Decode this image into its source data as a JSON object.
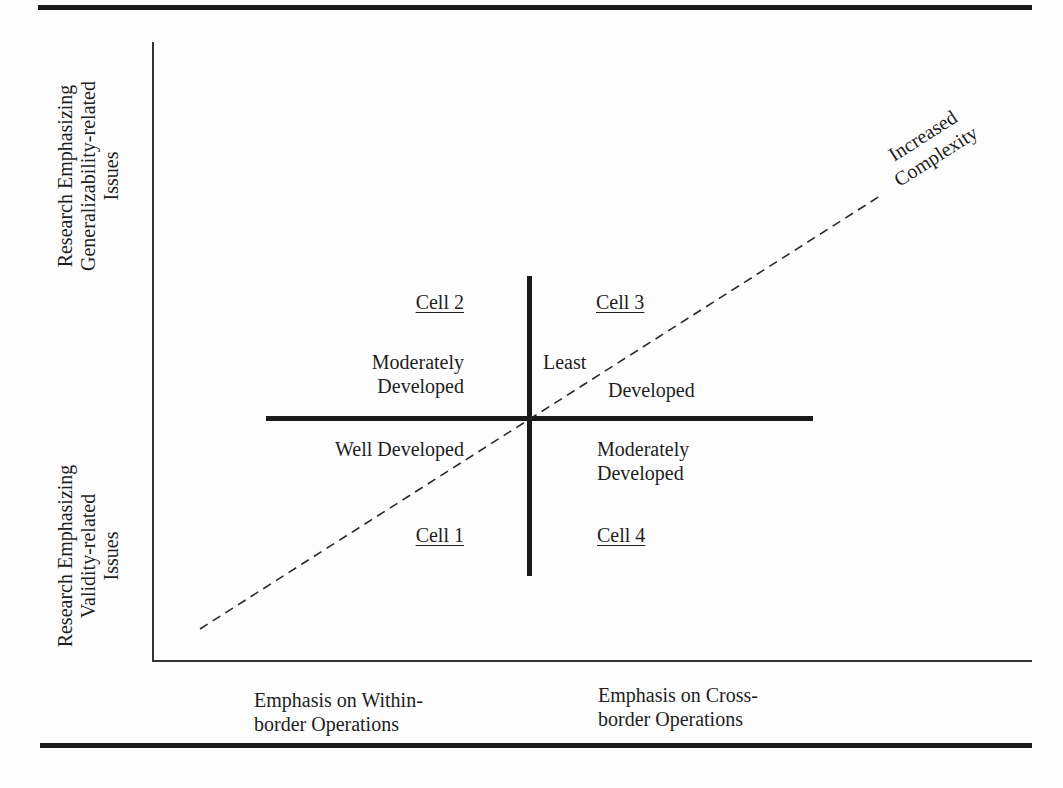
{
  "figure": {
    "y_axis": {
      "upper_label": [
        "Research Emphasizing",
        "Generalizability-related",
        "Issues"
      ],
      "lower_label": [
        "Research Emphasizing",
        "Validity-related",
        "Issues"
      ]
    },
    "x_axis": {
      "left_label": [
        "Emphasis on Within-",
        "border Operations"
      ],
      "right_label": [
        "Emphasis on Cross-",
        "border Operations"
      ]
    },
    "diagonal": {
      "label": [
        "Increased",
        "Complexity"
      ],
      "style": "dashed"
    },
    "cells": [
      {
        "id": "cell-1",
        "title": "Cell 1",
        "description": [
          "Well Developed"
        ]
      },
      {
        "id": "cell-2",
        "title": "Cell 2",
        "description": [
          "Moderately",
          "Developed"
        ]
      },
      {
        "id": "cell-3",
        "title": "Cell 3",
        "description": [
          "Least",
          "Developed"
        ]
      },
      {
        "id": "cell-4",
        "title": "Cell 4",
        "description": [
          "Moderately",
          "Developed"
        ]
      }
    ],
    "colors": {
      "ink": "#1a1a1a",
      "background": "#fdfdfd"
    }
  }
}
